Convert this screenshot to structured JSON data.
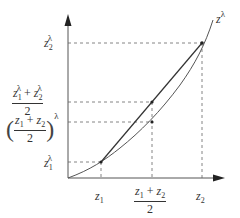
{
  "diagram": {
    "type": "convex-function-illustration",
    "curve_label": {
      "base": "z",
      "exponent": "λ"
    },
    "y_labels": [
      {
        "id": "z2-lambda",
        "base": "z",
        "sub": "2",
        "sup": "λ"
      },
      {
        "id": "mean-of-powers",
        "num_a_base": "z",
        "num_a_sub": "1",
        "num_a_sup": "λ",
        "plus": "+",
        "num_b_base": "z",
        "num_b_sub": "2",
        "num_b_sup": "λ",
        "den": "2"
      },
      {
        "id": "power-of-mean",
        "num_a_base": "z",
        "num_a_sub": "1",
        "plus": "+",
        "num_b_base": "z",
        "num_b_sub": "2",
        "den": "2",
        "open": "(",
        "close": ")",
        "sup": "λ"
      },
      {
        "id": "z1-lambda",
        "base": "z",
        "sub": "1",
        "sup": "λ"
      }
    ],
    "x_labels": [
      {
        "id": "z1",
        "base": "z",
        "sub": "1"
      },
      {
        "id": "midpoint",
        "num_a_base": "z",
        "num_a_sub": "1",
        "plus": "+",
        "num_b_base": "z",
        "num_b_sub": "2",
        "den": "2"
      },
      {
        "id": "z2",
        "base": "z",
        "sub": "2"
      }
    ],
    "colors": {
      "line": "#444444",
      "dash": "#555555",
      "text": "#333333"
    }
  }
}
